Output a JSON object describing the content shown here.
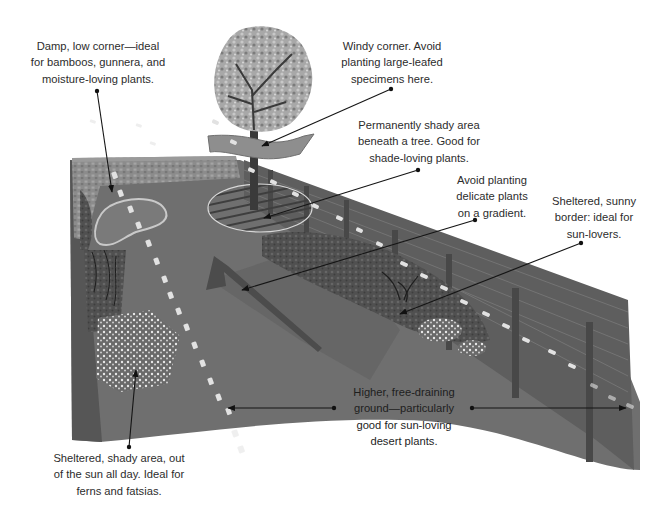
{
  "diagram": {
    "style": "grayscale isometric illustration",
    "colors": {
      "background": "#ffffff",
      "lawn": "#6e6e6e",
      "lawn_dark": "#5a5a5a",
      "wall": "#8a8a8a",
      "fence": "#5c5c5c",
      "fence_post": "#4a4a4a",
      "tree_foliage": "#9c9c9c",
      "path_dash": "#e6e6e6",
      "text": "#2c2c2c",
      "leader": "#1a1a1a"
    }
  },
  "annotations": [
    {
      "id": "damp-corner",
      "text": "Damp, low corner—ideal\nfor bamboos, gunnera, and\nmoisture-loving plants."
    },
    {
      "id": "windy-corner",
      "text": "Windy corner. Avoid\nplanting large-leafed\nspecimens here."
    },
    {
      "id": "shady-tree",
      "text": "Permanently shady area\nbeneath a tree. Good for\nshade-loving plants."
    },
    {
      "id": "gradient",
      "text": "Avoid planting\ndelicate plants\non a gradient."
    },
    {
      "id": "sunny-border",
      "text": "Sheltered, sunny\nborder: ideal for\nsun-lovers."
    },
    {
      "id": "free-draining",
      "text": "Higher, free-draining\nground—particularly\ngood for sun-loving\ndesert plants."
    },
    {
      "id": "shady-area",
      "text": "Sheltered, shady area, out\nof the sun all day. Ideal for\nferns and fatsias."
    }
  ],
  "illustration_elements": [
    {
      "name": "tree",
      "description": "Deciduous tree at back of garden"
    },
    {
      "name": "wind-arrow",
      "description": "Curved arrow indicating wind direction"
    },
    {
      "name": "pond",
      "description": "Kidney-shaped pond in back-left corner"
    },
    {
      "name": "stone-wall",
      "description": "Low stone wall along back edge"
    },
    {
      "name": "fence",
      "description": "Panel fence with posts along right side"
    },
    {
      "name": "slope-arrow",
      "description": "Large arrow showing gradient direction"
    },
    {
      "name": "sun-path",
      "description": "Dashed lines indicating sun path"
    },
    {
      "name": "border-planting",
      "description": "Planted border along fence"
    },
    {
      "name": "fern-bed",
      "description": "Planting in sheltered shady corner"
    },
    {
      "name": "tree-shade",
      "description": "Hatched shaded circle under tree"
    }
  ]
}
